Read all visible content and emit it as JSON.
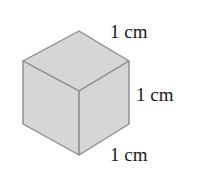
{
  "diagram": {
    "shape": "cube",
    "colors": {
      "fill": "#d6d6d6",
      "edge": "#8c8c8c",
      "text": "#1a1a1a"
    },
    "labels": {
      "top_edge": "1 cm",
      "right_edge": "1 cm",
      "bottom_edge": "1 cm"
    }
  }
}
